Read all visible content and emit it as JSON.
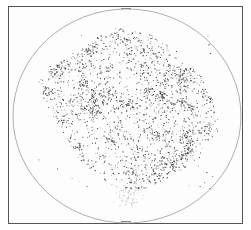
{
  "chart_data": {
    "type": "scatter",
    "title": "",
    "subtitle": "",
    "xlabel": "",
    "ylabel": "",
    "legend": [],
    "grid": false,
    "projection": "equal-area all-sky (circular boundary)",
    "boundary": {
      "shape": "ellipse",
      "cx": 127,
      "cy": 116,
      "rx": 114,
      "ry": 107
    },
    "cloud": {
      "approx_extent_px": {
        "x_min": 38,
        "x_max": 218,
        "y_min": 28,
        "y_max": 205
      },
      "density_peak_region_px": {
        "cx": 120,
        "cy": 115
      },
      "shape": "irregular blob, skewed toward upper-left, faint tail toward bottom center",
      "point_color": "#333333"
    },
    "colors": {
      "frame": "#555555",
      "boundary": "#9a9a9a",
      "points": "#3a3a3a",
      "background": "#ffffff"
    }
  }
}
